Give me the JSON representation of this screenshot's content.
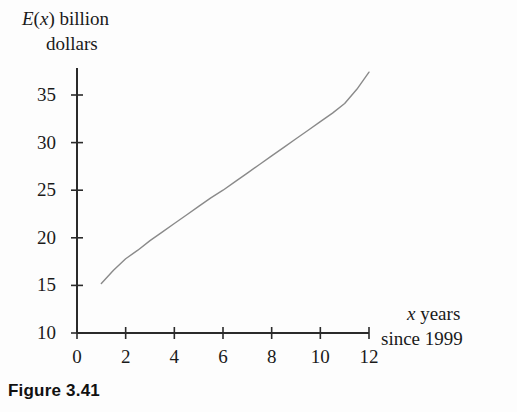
{
  "figure": {
    "caption": "Figure 3.41"
  },
  "axis_titles": {
    "y_line1_var": "E",
    "y_line1_paren_open": "(",
    "y_line1_inner": "x",
    "y_line1_paren_close": ")",
    "y_line1_rest": " billion",
    "y_line2": "dollars",
    "x_line1_var": "x",
    "x_line1_rest": " years",
    "x_line2": "since 1999"
  },
  "chart_data": {
    "type": "line",
    "title": "",
    "xlabel": "x years since 1999",
    "ylabel": "E(x) billion dollars",
    "xlim": [
      0,
      12
    ],
    "ylim": [
      10,
      37.5
    ],
    "xticks": [
      0,
      2,
      4,
      6,
      8,
      10,
      12
    ],
    "xtick_labels": [
      "0",
      "2",
      "4",
      "6",
      "8",
      "10",
      "12"
    ],
    "yticks": [
      10,
      15,
      20,
      25,
      30,
      35
    ],
    "ytick_labels": [
      "10",
      "15",
      "20",
      "25",
      "30",
      "35"
    ],
    "grid": false,
    "legend": null,
    "line_color": "#8a8a8a",
    "axis_color": "#2a2a2a",
    "series": [
      {
        "name": "E(x)",
        "x": [
          1,
          1.5,
          2,
          2.5,
          3,
          3.5,
          4,
          4.5,
          5,
          5.5,
          6,
          6.5,
          7,
          7.5,
          8,
          8.5,
          9,
          9.5,
          10,
          10.5,
          11,
          11.5,
          12
        ],
        "values": [
          15.2,
          16.6,
          17.8,
          18.7,
          19.7,
          20.6,
          21.5,
          22.4,
          23.3,
          24.2,
          25.0,
          25.9,
          26.8,
          27.7,
          28.6,
          29.5,
          30.4,
          31.3,
          32.2,
          33.1,
          34.1,
          35.6,
          37.4
        ]
      }
    ]
  }
}
